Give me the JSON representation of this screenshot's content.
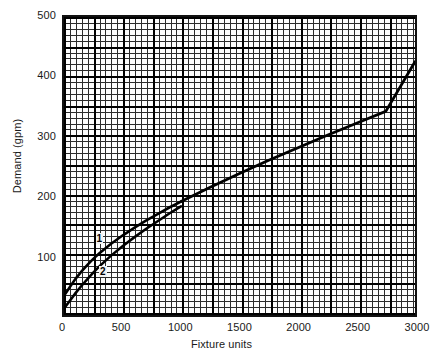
{
  "chart_data": {
    "type": "line",
    "title": "",
    "xlabel": "Fixture units",
    "ylabel": "Demand (gpm)",
    "xlim": [
      0,
      3000
    ],
    "ylim": [
      0,
      500
    ],
    "xticks": [
      0,
      500,
      1000,
      1500,
      2000,
      2500,
      3000
    ],
    "yticks": [
      100,
      200,
      300,
      400,
      500
    ],
    "xtick_labels": [
      "0",
      "500",
      "1000",
      "1500",
      "2000",
      "2500",
      "3000"
    ],
    "ytick_labels": [
      "100",
      "200",
      "300",
      "400",
      "500"
    ],
    "grid": "graph-paper minor and major",
    "minor_grid_step_x": 25,
    "minor_grid_step_y": 10,
    "major_grid_step_x": 125,
    "major_grid_step_y": 50,
    "legend": "none",
    "annotations": [
      {
        "text": "1",
        "x": 300,
        "y": 133
      },
      {
        "text": "2",
        "x": 330,
        "y": 78
      }
    ],
    "series": [
      {
        "name": "1",
        "label": "1",
        "color": "#000000",
        "x": [
          0,
          50,
          100,
          150,
          200,
          250,
          300,
          400,
          500,
          600,
          700,
          800,
          900,
          1000,
          1200,
          1400,
          1600,
          1800,
          2000,
          2200,
          2400,
          2600,
          2800,
          3000
        ],
        "y": [
          33,
          48,
          62,
          74,
          85,
          95,
          104,
          120,
          134,
          147,
          159,
          170,
          181,
          191,
          210,
          228,
          245,
          262,
          279,
          296,
          312,
          328,
          344,
          425
        ]
      },
      {
        "name": "2",
        "label": "2",
        "color": "#000000",
        "x": [
          0,
          50,
          100,
          150,
          200,
          250,
          300,
          400,
          500,
          600,
          700,
          800,
          900,
          1000,
          1200,
          1400,
          1600,
          1800,
          2000,
          2200,
          2400,
          2600,
          2800,
          3000
        ],
        "y": [
          12,
          25,
          38,
          50,
          61,
          72,
          82,
          100,
          116,
          131,
          145,
          158,
          171,
          183,
          205,
          225,
          244,
          262,
          279,
          296,
          312,
          328,
          344,
          425
        ]
      },
      {
        "name": "merged",
        "label": "",
        "color": "#000000",
        "x": [
          1000,
          1250,
          1500,
          1750,
          2000,
          2250,
          2500,
          2750,
          3000
        ],
        "y": [
          191,
          215,
          238,
          260,
          281,
          302,
          322,
          342,
          425
        ]
      }
    ]
  },
  "axes": {
    "x": {
      "label": "Fixture units",
      "ticks": [
        {
          "value": 0,
          "label": "0"
        },
        {
          "value": 500,
          "label": "500"
        },
        {
          "value": 1000,
          "label": "1000"
        },
        {
          "value": 1500,
          "label": "1500"
        },
        {
          "value": 2000,
          "label": "2000"
        },
        {
          "value": 2500,
          "label": "2500"
        },
        {
          "value": 3000,
          "label": "3000"
        }
      ]
    },
    "y": {
      "label": "Demand (gpm)",
      "ticks": [
        {
          "value": 100,
          "label": "100"
        },
        {
          "value": 200,
          "label": "200"
        },
        {
          "value": 300,
          "label": "300"
        },
        {
          "value": 400,
          "label": "400"
        },
        {
          "value": 500,
          "label": "500"
        }
      ]
    }
  },
  "curve_labels": {
    "one": "1",
    "two": "2"
  },
  "colors": {
    "curve": "#000000",
    "grid_minor": "#2b2b2b",
    "grid_major": "#000000",
    "background": "#ffffff",
    "plot_background": "#fdfdfd"
  }
}
